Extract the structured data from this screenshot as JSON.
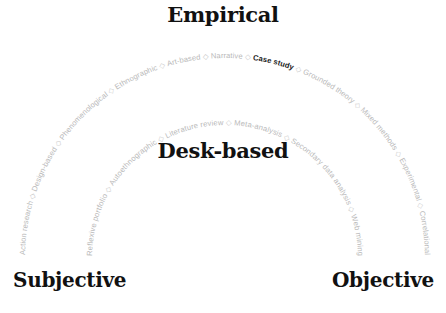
{
  "labels": {
    "top": "Empirical",
    "center": "Desk-based",
    "left": "Subjective",
    "right": "Objective"
  },
  "colors": {
    "title": "#111111",
    "muted_item": "#b9b9b9",
    "highlight_item": "#1a1a1a",
    "separator": "#c8c8c8"
  },
  "separator_glyph": "◇",
  "outer_arc": {
    "name": "Empirical methods",
    "items": [
      {
        "label": "Action research",
        "highlighted": false
      },
      {
        "label": "Design-based",
        "highlighted": false
      },
      {
        "label": "Phenomenological",
        "highlighted": false
      },
      {
        "label": "Ethnographic",
        "highlighted": false
      },
      {
        "label": "Art-based",
        "highlighted": false
      },
      {
        "label": "Narrative",
        "highlighted": false
      },
      {
        "label": "Case study",
        "highlighted": true
      },
      {
        "label": "Grounded theory",
        "highlighted": false
      },
      {
        "label": "Mixed methods",
        "highlighted": false
      },
      {
        "label": "Experimental",
        "highlighted": false
      },
      {
        "label": "Correlational",
        "highlighted": false
      }
    ]
  },
  "inner_arc": {
    "name": "Desk-based methods",
    "items": [
      {
        "label": "Reflexive portfolio",
        "highlighted": false
      },
      {
        "label": "Autoethnographic",
        "highlighted": false
      },
      {
        "label": "Literature review",
        "highlighted": false
      },
      {
        "label": "Meta-analysis",
        "highlighted": false
      },
      {
        "label": "Secondary data analysis",
        "highlighted": false
      },
      {
        "label": "Web mining",
        "highlighted": false
      }
    ]
  }
}
